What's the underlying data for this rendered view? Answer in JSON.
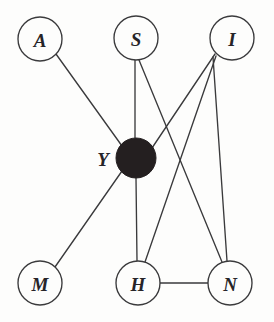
{
  "diagram": {
    "type": "undirected-graph",
    "title": "",
    "background_color": "#fdfdfc",
    "edge_color": "#3a3a3c",
    "node_stroke_color": "#3a3a3c",
    "node_fill_open": "#fdfdfc",
    "node_fill_latent": "#241f20",
    "label_color": "#262428",
    "nodes": [
      {
        "id": "A",
        "label": "A",
        "cx": 40,
        "cy": 39,
        "r": 22,
        "style": "open",
        "label_position": "inside",
        "label_x": 40,
        "label_y": 40
      },
      {
        "id": "S",
        "label": "S",
        "cx": 136,
        "cy": 38,
        "r": 22,
        "style": "open",
        "label_position": "inside",
        "label_x": 136,
        "label_y": 39
      },
      {
        "id": "I",
        "label": "I",
        "cx": 232,
        "cy": 38,
        "r": 22,
        "style": "open",
        "label_position": "inside",
        "label_x": 232,
        "label_y": 39
      },
      {
        "id": "Y",
        "label": "Y",
        "cx": 136,
        "cy": 158,
        "r": 20,
        "style": "filled",
        "label_position": "left",
        "label_x": 103,
        "label_y": 159
      },
      {
        "id": "M",
        "label": "M",
        "cx": 40,
        "cy": 283,
        "r": 22,
        "style": "open",
        "label_position": "inside",
        "label_x": 40,
        "label_y": 284
      },
      {
        "id": "H",
        "label": "H",
        "cx": 138,
        "cy": 283,
        "r": 22,
        "style": "open",
        "label_position": "inside",
        "label_x": 138,
        "label_y": 284
      },
      {
        "id": "N",
        "label": "N",
        "cx": 230,
        "cy": 283,
        "r": 22,
        "style": "open",
        "label_position": "inside",
        "label_x": 230,
        "label_y": 284
      }
    ],
    "edges": [
      {
        "id": "A-Y",
        "source": "A",
        "target": "Y",
        "x1": 56,
        "y1": 54,
        "x2": 122,
        "y2": 146
      },
      {
        "id": "S-Y",
        "source": "S",
        "target": "Y",
        "x1": 135,
        "y1": 60,
        "x2": 135,
        "y2": 138
      },
      {
        "id": "S-N",
        "source": "S",
        "target": "N",
        "x1": 139,
        "y1": 60,
        "x2": 222,
        "y2": 262
      },
      {
        "id": "I-Y",
        "source": "I",
        "target": "Y",
        "x1": 215,
        "y1": 54,
        "x2": 152,
        "y2": 148
      },
      {
        "id": "I-H",
        "source": "I",
        "target": "N",
        "x1": 213,
        "y1": 57,
        "x2": 227,
        "y2": 261
      },
      {
        "id": "I-H2",
        "source": "I",
        "target": "H",
        "x1": 216,
        "y1": 56,
        "x2": 145,
        "y2": 262
      },
      {
        "id": "Y-M",
        "source": "Y",
        "target": "M",
        "x1": 122,
        "y1": 171,
        "x2": 55,
        "y2": 267
      },
      {
        "id": "Y-H",
        "source": "Y",
        "target": "H",
        "x1": 136,
        "y1": 178,
        "x2": 137,
        "y2": 261
      },
      {
        "id": "H-N",
        "source": "H",
        "target": "N",
        "x1": 160,
        "y1": 283,
        "x2": 208,
        "y2": 283
      }
    ]
  }
}
